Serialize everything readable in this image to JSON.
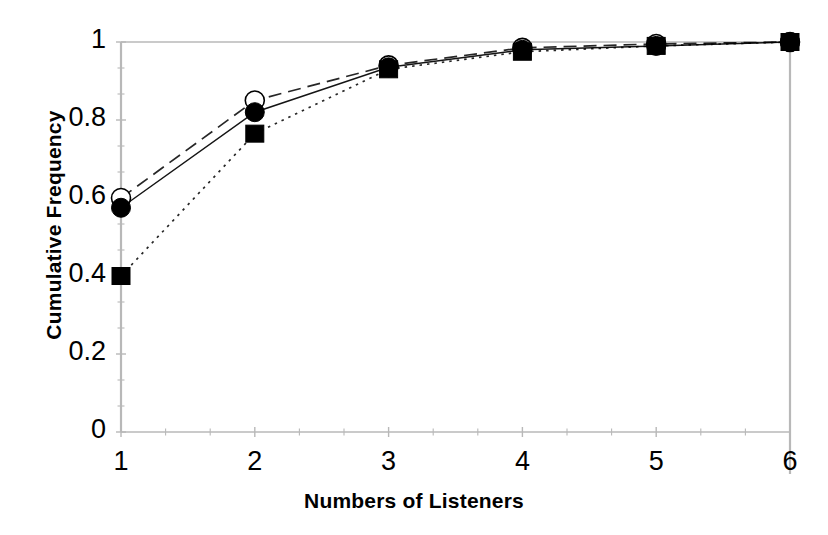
{
  "chart_data": {
    "type": "line",
    "title": "",
    "subtitle": "",
    "xlabel": "Numbers of Listeners",
    "ylabel": "Cumulative Frequency",
    "x": [
      1,
      2,
      3,
      4,
      5,
      6
    ],
    "xtick_labels": [
      "1",
      "2",
      "3",
      "4",
      "5",
      "6"
    ],
    "ytick_labels": [
      "0",
      "0.2",
      "0.4",
      "0.6",
      "0.8",
      "1"
    ],
    "ytick_values": [
      0,
      0.2,
      0.4,
      0.6,
      0.8,
      1
    ],
    "xlim": [
      1,
      6
    ],
    "ylim": [
      0,
      1
    ],
    "grid": false,
    "legend_position": "none",
    "x_minor_ticks_per_interval": 2,
    "y_minor_ticks_per_interval": 2,
    "axis_color": "#b8b8b8",
    "series": [
      {
        "name": "series-open-circle",
        "marker": "open-circle",
        "line_style": "dashed",
        "color": "#000000",
        "values": [
          0.6,
          0.85,
          0.94,
          0.985,
          0.995,
          1.0
        ]
      },
      {
        "name": "series-filled-circle",
        "marker": "filled-circle",
        "line_style": "solid",
        "color": "#000000",
        "values": [
          0.575,
          0.82,
          0.935,
          0.98,
          0.99,
          1.0
        ]
      },
      {
        "name": "series-filled-square",
        "marker": "filled-square",
        "line_style": "dotted",
        "color": "#000000",
        "values": [
          0.4,
          0.765,
          0.93,
          0.975,
          0.99,
          1.0
        ]
      }
    ]
  }
}
